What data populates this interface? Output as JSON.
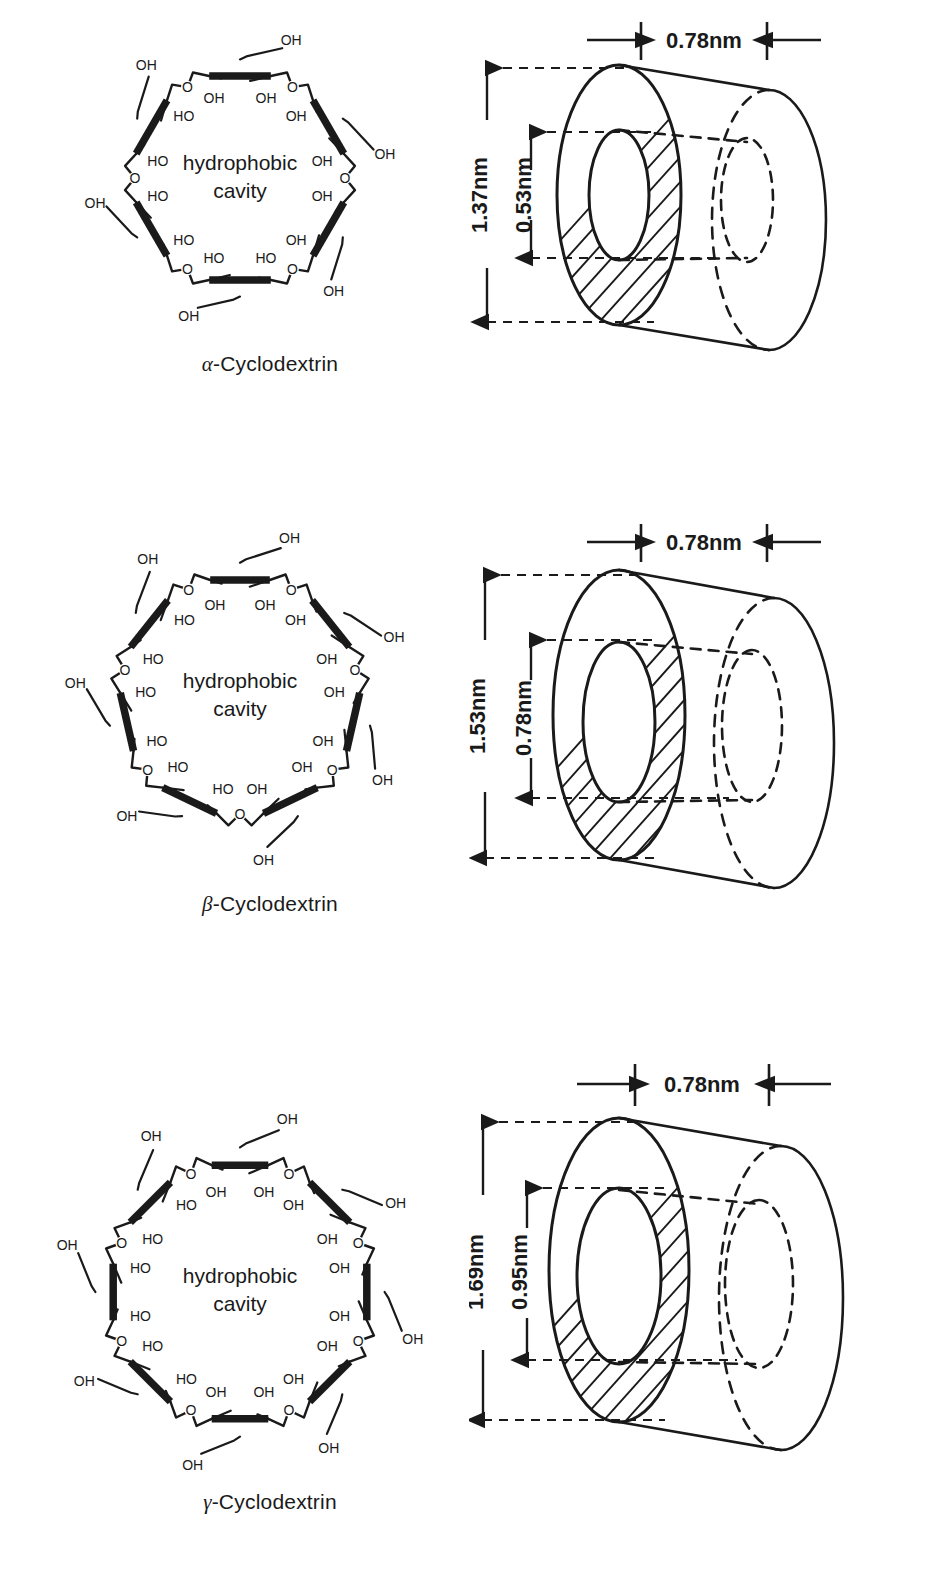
{
  "figure": {
    "title_visible": false,
    "ink_color": "#1a1a1a",
    "background": "#ffffff"
  },
  "cavity_label": {
    "line1": "hydrophobic",
    "line2": "cavity"
  },
  "atom_labels": {
    "hydroxyl_right": "OH",
    "hydroxyl_left": "HO",
    "oxygen": "O"
  },
  "panels": [
    {
      "id": "alpha",
      "caption_greek": "α",
      "caption_rest": "-Cyclodextrin",
      "caption_full": "α-Cyclodextrin",
      "glucose_units": 6,
      "cavity": {
        "line1": "hydrophobic",
        "line2": "cavity"
      },
      "dimensions": {
        "rim_width": "0.78nm",
        "outer_diameter": "1.37nm",
        "cavity_diameter": "0.53nm"
      }
    },
    {
      "id": "beta",
      "caption_greek": "β",
      "caption_rest": "-Cyclodextrin",
      "caption_full": "β-Cyclodextrin",
      "glucose_units": 7,
      "cavity": {
        "line1": "hydrophobic",
        "line2": "cavity"
      },
      "dimensions": {
        "rim_width": "0.78nm",
        "outer_diameter": "1.53nm",
        "cavity_diameter": "0.78nm"
      }
    },
    {
      "id": "gamma",
      "caption_greek": "γ",
      "caption_rest": "-Cyclodextrin",
      "caption_full": "γ-Cyclodextrin",
      "glucose_units": 8,
      "cavity": {
        "line1": "hydrophobic",
        "line2": "cavity"
      },
      "dimensions": {
        "rim_width": "0.78nm",
        "outer_diameter": "1.69nm",
        "cavity_diameter": "0.95nm"
      }
    }
  ]
}
